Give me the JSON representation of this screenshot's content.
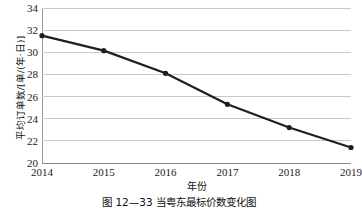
{
  "chart_data": {
    "type": "line",
    "title": "",
    "xlabel": "年份",
    "ylabel": "平均订单数/[单/(年·日)]",
    "categories": [
      "2014",
      "2015",
      "2016",
      "2017",
      "2018",
      "2019"
    ],
    "x": [
      2014,
      2015,
      2016,
      2017,
      2018,
      2019
    ],
    "values": [
      31.5,
      30.15,
      28.1,
      25.3,
      23.2,
      21.4
    ],
    "series": [
      {
        "name": "平均订单数",
        "values": [
          31.5,
          30.15,
          28.1,
          25.3,
          23.2,
          21.4
        ]
      }
    ],
    "ylim": [
      20,
      34
    ],
    "yticks": [
      "20",
      "22",
      "24",
      "26",
      "28",
      "30",
      "32",
      "34"
    ],
    "ytick_values": [
      20,
      22,
      24,
      26,
      28,
      30,
      32,
      34
    ],
    "xlim": [
      2014,
      2019
    ],
    "grid": "horizontal",
    "legend": "none",
    "line_color": "#1f1f1f",
    "marker": "circle",
    "marker_color": "#1f1f1f",
    "gridline_color": "#c9c9c9",
    "axis_color": "#8a8a8a"
  },
  "caption": {
    "text": "图 12—33  当粤东最标价数变化图"
  }
}
